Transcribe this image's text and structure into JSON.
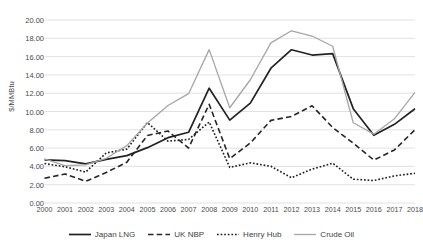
{
  "chart_data": {
    "type": "line",
    "title": "",
    "xlabel": "",
    "ylabel": "$/MMBtu",
    "ylim": [
      0,
      20
    ],
    "ytick_step": 2,
    "grid": true,
    "legend_position": "bottom",
    "categories": [
      "2000",
      "2001",
      "2002",
      "2003",
      "2004",
      "2005",
      "2006",
      "2007",
      "2008",
      "2009",
      "2010",
      "2011",
      "2012",
      "2013",
      "2014",
      "2015",
      "2016",
      "2017",
      "2018"
    ],
    "series": [
      {
        "name": "Japan LNG",
        "style": "solid",
        "color": "#222222",
        "values": [
          4.72,
          4.64,
          4.27,
          4.77,
          5.18,
          6.05,
          7.14,
          7.73,
          12.55,
          9.06,
          10.91,
          14.73,
          16.75,
          16.17,
          16.33,
          10.31,
          7.4,
          8.6,
          10.3
        ]
      },
      {
        "name": "UK NBP",
        "style": "dashed",
        "color": "#262626",
        "values": [
          2.71,
          3.17,
          2.37,
          3.33,
          4.46,
          7.38,
          7.87,
          6.01,
          10.79,
          4.85,
          6.56,
          9.03,
          9.46,
          10.63,
          8.25,
          6.53,
          4.69,
          5.8,
          8.0
        ]
      },
      {
        "name": "Henry Hub",
        "style": "dotted",
        "color": "#1f1f1f",
        "values": [
          4.31,
          3.96,
          3.38,
          5.47,
          5.89,
          8.79,
          6.76,
          6.95,
          8.85,
          3.89,
          4.39,
          4.01,
          2.76,
          3.71,
          4.35,
          2.6,
          2.46,
          2.96,
          3.25
        ]
      },
      {
        "name": "Crude Oil",
        "style": "solid-light",
        "color": "#a6a6a6",
        "values": [
          4.83,
          4.08,
          4.17,
          4.89,
          6.27,
          8.74,
          10.66,
          11.95,
          16.76,
          10.41,
          13.47,
          17.5,
          18.82,
          18.25,
          17.13,
          8.77,
          7.52,
          9.2,
          12.1
        ]
      }
    ]
  },
  "axes": {
    "y_tick_labels": [
      "20.00",
      "18.00",
      "16.00",
      "14.00",
      "12.00",
      "10.00",
      "8.00",
      "6.00",
      "4.00",
      "2.00",
      "0.00"
    ],
    "y_tick_values": [
      20,
      18,
      16,
      14,
      12,
      10,
      8,
      6,
      4,
      2,
      0
    ]
  },
  "legend": {
    "items": [
      {
        "label": "Japan LNG",
        "icon": "solid-line-icon"
      },
      {
        "label": "UK NBP",
        "icon": "dashed-line-icon"
      },
      {
        "label": "Henry Hub",
        "icon": "dotted-line-icon"
      },
      {
        "label": "Crude Oil",
        "icon": "light-solid-line-icon"
      }
    ]
  }
}
